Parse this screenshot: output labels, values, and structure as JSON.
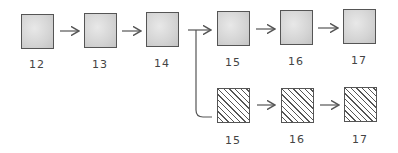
{
  "diagram": {
    "top_row": [
      {
        "label": "12",
        "style": "shaded"
      },
      {
        "label": "13",
        "style": "shaded"
      },
      {
        "label": "14",
        "style": "shaded"
      },
      {
        "label": "15",
        "style": "shaded"
      },
      {
        "label": "16",
        "style": "shaded"
      },
      {
        "label": "17",
        "style": "shaded"
      }
    ],
    "bottom_row": [
      {
        "label": "15",
        "style": "hatched"
      },
      {
        "label": "16",
        "style": "hatched"
      },
      {
        "label": "17",
        "style": "hatched"
      }
    ],
    "colors": {
      "stroke": "#555555",
      "shade": "#d4d4d4",
      "background": "#ffffff"
    }
  }
}
